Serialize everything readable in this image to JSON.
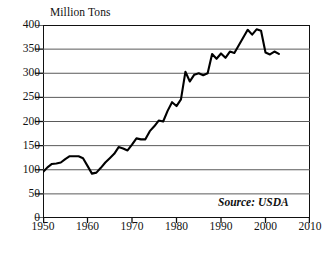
{
  "chart_data": {
    "type": "line",
    "title": "",
    "ylabel": "Million Tons",
    "xlabel": "",
    "ylim": [
      0,
      400
    ],
    "xlim": [
      1950,
      2010
    ],
    "y_ticks": [
      0,
      50,
      100,
      150,
      200,
      250,
      300,
      350,
      400
    ],
    "x_ticks": [
      1950,
      1960,
      1970,
      1980,
      1990,
      2000,
      2010
    ],
    "grid": "horizontal",
    "legend": "none",
    "line_color": "#000000",
    "grid_color": "#5a5a5a",
    "axis_color": "#111111",
    "background": "#ffffff",
    "annotation": "Source: USDA",
    "series": [
      {
        "name": "Production",
        "x": [
          1950,
          1951,
          1952,
          1953,
          1954,
          1955,
          1956,
          1957,
          1958,
          1959,
          1960,
          1961,
          1962,
          1963,
          1964,
          1965,
          1966,
          1967,
          1968,
          1969,
          1970,
          1971,
          1972,
          1973,
          1974,
          1975,
          1976,
          1977,
          1978,
          1979,
          1980,
          1981,
          1982,
          1983,
          1984,
          1985,
          1986,
          1987,
          1988,
          1989,
          1990,
          1991,
          1992,
          1993,
          1994,
          1995,
          1996,
          1997,
          1998,
          1999,
          2000,
          2001,
          2002,
          2003
        ],
        "values": [
          95,
          105,
          112,
          113,
          115,
          122,
          128,
          128,
          128,
          124,
          108,
          92,
          94,
          104,
          115,
          124,
          133,
          147,
          144,
          140,
          152,
          165,
          163,
          163,
          180,
          190,
          202,
          200,
          222,
          240,
          232,
          246,
          303,
          283,
          297,
          300,
          296,
          300,
          340,
          330,
          341,
          332,
          345,
          342,
          358,
          374,
          390,
          380,
          391,
          388,
          343,
          339,
          345,
          340
        ]
      }
    ]
  },
  "axis": {
    "y_unit_caption": "Million Tons",
    "y_tick_labels": [
      "400",
      "350",
      "300",
      "250",
      "200",
      "150",
      "100",
      "50",
      "0"
    ],
    "x_tick_labels": [
      "1950",
      "1960",
      "1970",
      "1980",
      "1990",
      "2000",
      "2010"
    ]
  },
  "source": {
    "text": "Source: USDA"
  }
}
